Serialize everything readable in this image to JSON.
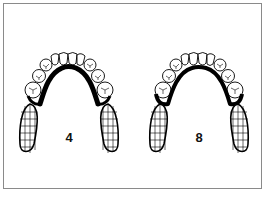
{
  "diagram": {
    "type": "dental-partial-denture-framework",
    "view": "occlusal",
    "figures": [
      {
        "label": "4",
        "connector": "lingual-bar",
        "teeth": 10,
        "saddles": 2
      },
      {
        "label": "8",
        "connector": "lingual-bar",
        "teeth": 10,
        "saddles": 2
      }
    ]
  },
  "colors": {
    "border": "#8a8a8a",
    "ink": "#000000",
    "background": "#ffffff"
  }
}
